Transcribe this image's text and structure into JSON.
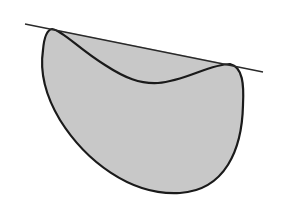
{
  "diagram": {
    "type": "convex-hull-illustration",
    "colors": {
      "background": "#ffffff",
      "fill": "#c8c8c8",
      "stroke": "#1a1a1a",
      "line": "#2a2a2a"
    },
    "tangent_line": {
      "x1": 25,
      "y1": 24,
      "x2": 263,
      "y2": 72
    },
    "tangent_points": [
      {
        "x": 52,
        "y": 29
      },
      {
        "x": 233,
        "y": 65
      }
    ]
  }
}
